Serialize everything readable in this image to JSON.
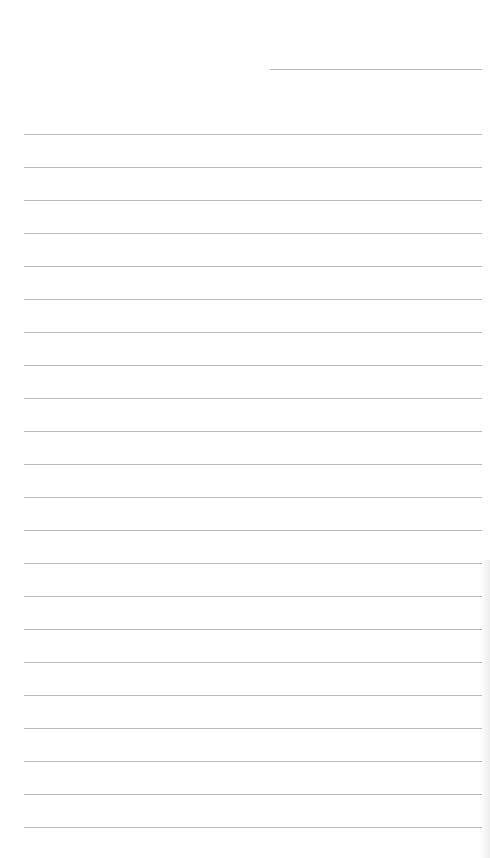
{
  "page": {
    "type": "lined-paper",
    "background_color": "#ffffff",
    "line_color": "#b9b9b9",
    "header_line": {
      "x": 270,
      "y": 69,
      "width": 212
    },
    "ruled_lines": {
      "count": 22,
      "start_y": 134,
      "spacing": 33,
      "x": 24,
      "width": 458
    }
  }
}
